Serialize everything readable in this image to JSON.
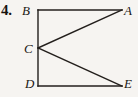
{
  "figure": {
    "problem_number": "4.",
    "background_color": "#f6f4f1",
    "stroke_color": "#231f1c",
    "label_color": "#1a1714",
    "vertices": [
      {
        "name": "B",
        "label": "B",
        "x": 38,
        "y": 10,
        "label_x": 22,
        "label_y": 4
      },
      {
        "name": "A",
        "label": "A",
        "x": 122,
        "y": 10,
        "label_x": 124,
        "label_y": 4
      },
      {
        "name": "C",
        "label": "C",
        "x": 38,
        "y": 48,
        "label_x": 24,
        "label_y": 42
      },
      {
        "name": "D",
        "label": "D",
        "x": 38,
        "y": 86,
        "label_x": 25,
        "label_y": 77
      },
      {
        "name": "E",
        "label": "E",
        "x": 122,
        "y": 86,
        "label_x": 124,
        "label_y": 77
      }
    ],
    "segments": [
      {
        "name": "segment-BA",
        "from": "B",
        "to": "A",
        "x1": 38,
        "y1": 10,
        "x2": 122,
        "y2": 10
      },
      {
        "name": "segment-BD",
        "from": "B",
        "to": "D",
        "x1": 38,
        "y1": 10,
        "x2": 38,
        "y2": 86
      },
      {
        "name": "segment-DE",
        "from": "D",
        "to": "E",
        "x1": 38,
        "y1": 86,
        "x2": 122,
        "y2": 86
      },
      {
        "name": "segment-CA",
        "from": "C",
        "to": "A",
        "x1": 38,
        "y1": 48,
        "x2": 122,
        "y2": 10
      },
      {
        "name": "segment-CE",
        "from": "C",
        "to": "E",
        "x1": 38,
        "y1": 48,
        "x2": 122,
        "y2": 86
      }
    ]
  }
}
